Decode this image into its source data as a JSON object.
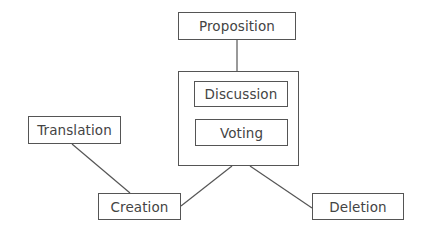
{
  "diagram": {
    "type": "flow",
    "nodes": {
      "proposition": {
        "label": "Proposition",
        "x": 178,
        "y": 12,
        "w": 118,
        "h": 28
      },
      "group": {
        "label": "",
        "x": 178,
        "y": 71,
        "w": 121,
        "h": 95
      },
      "discussion": {
        "label": "Discussion",
        "x": 194,
        "y": 81,
        "w": 94,
        "h": 26
      },
      "voting": {
        "label": "Voting",
        "x": 195,
        "y": 119,
        "w": 93,
        "h": 27
      },
      "translation": {
        "label": "Translation",
        "x": 28,
        "y": 116,
        "w": 93,
        "h": 28
      },
      "creation": {
        "label": "Creation",
        "x": 98,
        "y": 193,
        "w": 83,
        "h": 27
      },
      "deletion": {
        "label": "Deletion",
        "x": 312,
        "y": 193,
        "w": 92,
        "h": 27
      }
    },
    "edges": [
      {
        "from": "proposition",
        "to": "group",
        "x1": 237,
        "y1": 40,
        "x2": 237,
        "y2": 71
      },
      {
        "from": "translation",
        "to": "creation",
        "x1": 72,
        "y1": 144,
        "x2": 130,
        "y2": 193
      },
      {
        "from": "creation",
        "to": "group",
        "x1": 181,
        "y1": 206,
        "x2": 232,
        "y2": 166
      },
      {
        "from": "group",
        "to": "deletion",
        "x1": 250,
        "y1": 166,
        "x2": 312,
        "y2": 208
      }
    ],
    "colors": {
      "stroke": "#555555",
      "text": "#444444",
      "background": "#ffffff"
    }
  }
}
